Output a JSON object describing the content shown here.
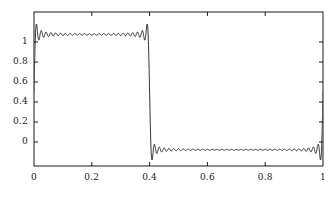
{
  "chart_data": {
    "type": "line",
    "title": "",
    "xlabel": "",
    "ylabel": "",
    "xlim": [
      0,
      1
    ],
    "ylim": [
      -0.28,
      1.28
    ],
    "grid": false,
    "legend": null,
    "xticks": [
      0,
      0.2,
      0.4,
      0.6,
      0.8,
      1
    ],
    "xtick_labels": [
      "0",
      "0.2",
      "0.4",
      "0.6",
      "0.8",
      "1"
    ],
    "yticks": [
      0,
      0.2,
      0.4,
      0.6,
      0.8,
      1
    ],
    "ytick_labels": [
      "0",
      "0.2",
      "0.4",
      "0.6",
      "0.8",
      "1"
    ],
    "series": [
      {
        "name": "fourier-partial-sum",
        "color": "#000000",
        "linewidth": 0.8,
        "step_location": 0.6,
        "baseline_low": 0.0,
        "baseline_high": 1.0,
        "overshoot_max": 1.18,
        "undershoot_min": -0.18,
        "oscillation_terms": 60,
        "sample_count": 2400
      }
    ],
    "annotations": []
  },
  "axes": {
    "frame_color": "#000000",
    "frame_linewidth": 0.8,
    "tick_length": 4,
    "tick_color": "#000000",
    "background": "#ffffff"
  }
}
